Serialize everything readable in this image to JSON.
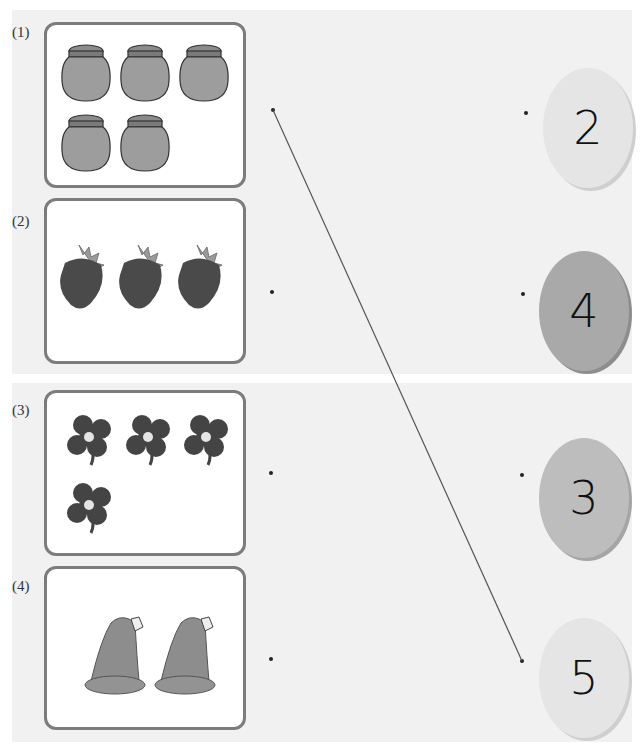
{
  "items": [
    {
      "label": "(1)",
      "picture": "jars",
      "count": 5
    },
    {
      "label": "(2)",
      "picture": "strawberries",
      "count": 3
    },
    {
      "label": "(3)",
      "picture": "clovers",
      "count": 4
    },
    {
      "label": "(4)",
      "picture": "hats",
      "count": 2
    }
  ],
  "numbers": [
    {
      "value": "2"
    },
    {
      "value": "4"
    },
    {
      "value": "3"
    },
    {
      "value": "5"
    }
  ],
  "connections": [
    {
      "from": "(1)",
      "to": "5"
    }
  ],
  "colors": {
    "panel_bg": "#f1f1f1",
    "card_border": "#7c7c7c",
    "connector_line": "#555555"
  }
}
